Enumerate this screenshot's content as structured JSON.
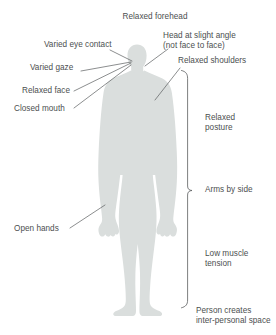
{
  "figure": {
    "background_color": "#ffffff",
    "silhouette_color": "#dadedd",
    "line_color": "#5a5d5e",
    "text_color": "#4c4f50"
  },
  "labels": {
    "top_center": "Relaxed forehead",
    "head_angle_line1": "Head at slight angle",
    "head_angle_line2": "(not face to face)",
    "relaxed_shoulders": "Relaxed shoulders",
    "varied_eye_contact": "Varied eye contact",
    "varied_gaze": "Varied gaze",
    "relaxed_face": "Relaxed face",
    "closed_mouth": "Closed mouth",
    "open_hands": "Open hands",
    "relaxed_posture_line1": "Relaxed",
    "relaxed_posture_line2": "posture",
    "arms_by_side": "Arms by side",
    "low_muscle_line1": "Low muscle",
    "low_muscle_line2": "tension",
    "personal_space_line1": "Person creates",
    "personal_space_line2": "inter-personal space"
  },
  "annotations": [
    {
      "name": "relaxed-forehead",
      "target": "forehead"
    },
    {
      "name": "head-at-slight-angle",
      "target": "head"
    },
    {
      "name": "relaxed-shoulders",
      "target": "shoulder"
    },
    {
      "name": "varied-eye-contact",
      "target": "eyes"
    },
    {
      "name": "varied-gaze",
      "target": "eyes"
    },
    {
      "name": "relaxed-face",
      "target": "face"
    },
    {
      "name": "closed-mouth",
      "target": "mouth"
    },
    {
      "name": "open-hands",
      "target": "hand"
    },
    {
      "name": "relaxed-posture",
      "target": "brace"
    },
    {
      "name": "arms-by-side",
      "target": "brace-mid"
    },
    {
      "name": "low-muscle-tension",
      "target": "brace"
    },
    {
      "name": "person-creates-inter-personal-space",
      "target": "brace-bottom"
    }
  ]
}
